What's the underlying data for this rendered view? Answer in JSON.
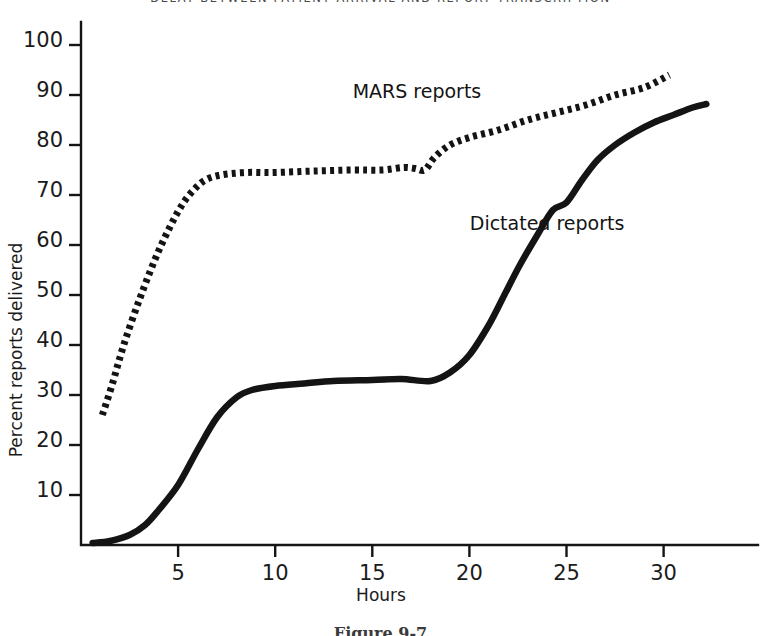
{
  "figure": {
    "title": "DELAY BETWEEN PATIENT ARRIVAL AND REPORT TRANSCRIPTION",
    "caption": "Figure 9-7"
  },
  "chart_data": {
    "type": "line",
    "title": "DELAY BETWEEN PATIENT ARRIVAL AND REPORT TRANSCRIPTION",
    "xlabel": "Hours",
    "ylabel": "Percent reports delivered",
    "xlim": [
      0,
      35
    ],
    "ylim": [
      0,
      100
    ],
    "xticks": [
      5,
      10,
      15,
      20,
      25,
      30
    ],
    "yticks": [
      10,
      20,
      30,
      40,
      50,
      60,
      70,
      80,
      90,
      100
    ],
    "xtick_labels": [
      "5",
      "10",
      "15",
      "20",
      "25",
      "30"
    ],
    "ytick_labels": [
      "10",
      "20",
      "30",
      "40",
      "50",
      "60",
      "70",
      "80",
      "90",
      "100"
    ],
    "grid": false,
    "legend": "inline-annotations",
    "series": [
      {
        "name": "MARS reports",
        "style": "dotted",
        "color": "#141414",
        "label_x": 17.3,
        "label_y": 89.5,
        "x": [
          1.1,
          1.6,
          2.2,
          3.0,
          3.8,
          4.5,
          5.2,
          5.8,
          6.4,
          7.2,
          8.5,
          10.0,
          12.0,
          14.0,
          15.5,
          16.6,
          17.2,
          17.7,
          18.2,
          19.0,
          20.0,
          21.5,
          23.0,
          24.5,
          26.0,
          27.5,
          29.0,
          30.3
        ],
        "y": [
          26,
          32,
          40,
          49,
          57,
          63,
          68,
          71,
          73,
          74,
          74.5,
          74.5,
          74.8,
          75,
          75,
          75.5,
          75.3,
          75,
          77.5,
          80,
          81.5,
          83,
          85,
          86.5,
          88,
          90,
          91.5,
          94
        ]
      },
      {
        "name": "Dictated reports",
        "style": "solid",
        "color": "#141414",
        "label_x": 24.0,
        "label_y": 63.0,
        "x": [
          0.6,
          1.5,
          2.5,
          3.3,
          4.0,
          5.0,
          6.0,
          7.0,
          8.0,
          8.8,
          10.0,
          11.5,
          13.0,
          15.0,
          16.5,
          18.0,
          19.0,
          20.0,
          21.0,
          21.8,
          22.6,
          23.5,
          24.3,
          25.0,
          25.8,
          26.6,
          27.5,
          28.5,
          29.5,
          30.5,
          31.5,
          32.2
        ],
        "y": [
          0.4,
          0.8,
          2.0,
          4.0,
          7.0,
          12.0,
          19.0,
          25.5,
          29.5,
          31.0,
          31.8,
          32.3,
          32.8,
          33.0,
          33.2,
          32.8,
          34.5,
          38.0,
          44.0,
          50.0,
          56.0,
          62.0,
          67.0,
          68.5,
          73.0,
          77.0,
          80.0,
          82.5,
          84.5,
          86.0,
          87.5,
          88.2
        ]
      }
    ]
  }
}
